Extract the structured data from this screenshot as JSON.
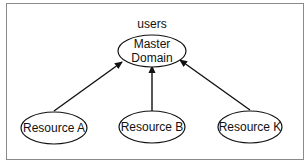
{
  "diagram": {
    "type": "trust-relationship",
    "frame_color": "#8a8a8a",
    "stroke_color": "#111111",
    "master": {
      "id": "master",
      "annotation": "users",
      "label_lines": [
        "Master",
        "Domain"
      ],
      "cx": 152,
      "cy": 51,
      "rx": 34,
      "ry": 16
    },
    "resources": [
      {
        "id": "resource-a",
        "label": "Resource A",
        "cx": 54,
        "cy": 128,
        "rx": 33,
        "ry": 16
      },
      {
        "id": "resource-b",
        "label": "Resource B",
        "cx": 152,
        "cy": 127,
        "rx": 33,
        "ry": 16
      },
      {
        "id": "resource-k",
        "label": "Resource K",
        "cx": 250,
        "cy": 127,
        "rx": 32,
        "ry": 16
      }
    ],
    "edges": [
      {
        "from": "resource-a",
        "to": "master",
        "x1": 54,
        "y1": 111,
        "x2": 122,
        "y2": 62
      },
      {
        "from": "resource-b",
        "to": "master",
        "x1": 152,
        "y1": 111,
        "x2": 152,
        "y2": 66
      },
      {
        "from": "resource-k",
        "to": "master",
        "x1": 250,
        "y1": 110,
        "x2": 180,
        "y2": 60
      }
    ]
  }
}
